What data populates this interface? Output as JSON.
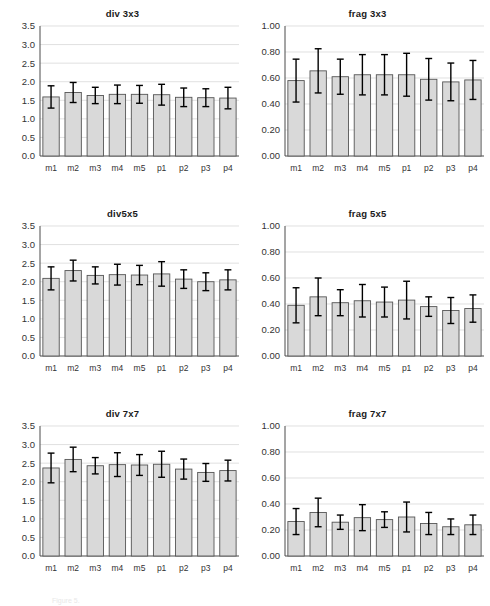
{
  "figure": {
    "background": "#ffffff",
    "bar_fill": "#d9d9d9",
    "bar_stroke": "#555555",
    "error_color": "#000000",
    "gridline_color": "#d2d2d2",
    "axis_color": "#4a4a4a",
    "caption_fragment": "Figure 5."
  },
  "chart_data": [
    {
      "type": "bar",
      "title": "div 3x3",
      "xlabel": "",
      "ylabel": "",
      "ylim": [
        0.0,
        3.5
      ],
      "yticks": [
        0.0,
        0.5,
        1.0,
        1.5,
        2.0,
        2.5,
        3.0,
        3.5
      ],
      "ytick_labels": [
        "0.0",
        "0.5",
        "1.0",
        "1.5",
        "2.0",
        "2.5",
        "3.0",
        "3.5"
      ],
      "grid": true,
      "legend": "none",
      "categories": [
        "m1",
        "m2",
        "m3",
        "m4",
        "m5",
        "p1",
        "p2",
        "p3",
        "p4"
      ],
      "values": [
        1.59,
        1.71,
        1.63,
        1.66,
        1.66,
        1.65,
        1.58,
        1.57,
        1.56
      ],
      "errors": [
        0.3,
        0.27,
        0.22,
        0.25,
        0.24,
        0.28,
        0.25,
        0.24,
        0.29
      ]
    },
    {
      "type": "bar",
      "title": "frag 3x3",
      "xlabel": "",
      "ylabel": "",
      "ylim": [
        0.0,
        1.0
      ],
      "yticks": [
        0.0,
        0.2,
        0.4,
        0.6,
        0.8,
        1.0
      ],
      "ytick_labels": [
        "0.00",
        "0.20",
        "0.40",
        "0.60",
        "0.80",
        "1.00"
      ],
      "grid": true,
      "legend": "none",
      "categories": [
        "m1",
        "m2",
        "m3",
        "m4",
        "m5",
        "p1",
        "p2",
        "p3",
        "p4"
      ],
      "values": [
        0.58,
        0.655,
        0.61,
        0.625,
        0.625,
        0.625,
        0.59,
        0.57,
        0.585
      ],
      "errors": [
        0.165,
        0.17,
        0.135,
        0.155,
        0.155,
        0.165,
        0.16,
        0.145,
        0.15
      ]
    },
    {
      "type": "bar",
      "title": "div5x5",
      "xlabel": "",
      "ylabel": "",
      "ylim": [
        0.0,
        3.5
      ],
      "yticks": [
        0.0,
        0.5,
        1.0,
        1.5,
        2.0,
        2.5,
        3.0,
        3.5
      ],
      "ytick_labels": [
        "0.0",
        "0.5",
        "1.0",
        "1.5",
        "2.0",
        "2.5",
        "3.0",
        "3.5"
      ],
      "grid": true,
      "legend": "none",
      "categories": [
        "m1",
        "m2",
        "m3",
        "m4",
        "m5",
        "p1",
        "p2",
        "p3",
        "p4"
      ],
      "values": [
        2.09,
        2.3,
        2.17,
        2.19,
        2.18,
        2.21,
        2.07,
        2.0,
        2.05
      ],
      "errors": [
        0.31,
        0.28,
        0.23,
        0.28,
        0.26,
        0.33,
        0.25,
        0.24,
        0.27
      ]
    },
    {
      "type": "bar",
      "title": "frag 5x5",
      "xlabel": "",
      "ylabel": "",
      "ylim": [
        0.0,
        1.0
      ],
      "yticks": [
        0.0,
        0.2,
        0.4,
        0.6,
        0.8,
        1.0
      ],
      "ytick_labels": [
        "0.00",
        "0.20",
        "0.40",
        "0.60",
        "0.80",
        "1.00"
      ],
      "grid": true,
      "legend": "none",
      "categories": [
        "m1",
        "m2",
        "m3",
        "m4",
        "m5",
        "p1",
        "p2",
        "p3",
        "p4"
      ],
      "values": [
        0.39,
        0.455,
        0.41,
        0.425,
        0.415,
        0.43,
        0.38,
        0.35,
        0.365
      ],
      "errors": [
        0.135,
        0.145,
        0.1,
        0.125,
        0.115,
        0.145,
        0.075,
        0.1,
        0.105
      ]
    },
    {
      "type": "bar",
      "title": "div 7x7",
      "xlabel": "",
      "ylabel": "",
      "ylim": [
        0.0,
        3.5
      ],
      "yticks": [
        0.0,
        0.5,
        1.0,
        1.5,
        2.0,
        2.5,
        3.0,
        3.5
      ],
      "ytick_labels": [
        "0.0",
        "0.5",
        "1.0",
        "1.5",
        "2.0",
        "2.5",
        "3.0",
        "3.5"
      ],
      "grid": true,
      "legend": "none",
      "categories": [
        "m1",
        "m2",
        "m3",
        "m4",
        "m5",
        "p1",
        "p2",
        "p3",
        "p4"
      ],
      "values": [
        2.37,
        2.6,
        2.43,
        2.46,
        2.45,
        2.47,
        2.34,
        2.25,
        2.3
      ],
      "errors": [
        0.4,
        0.33,
        0.22,
        0.32,
        0.28,
        0.35,
        0.27,
        0.24,
        0.28
      ]
    },
    {
      "type": "bar",
      "title": "frag 7x7",
      "xlabel": "",
      "ylabel": "",
      "ylim": [
        0.0,
        1.0
      ],
      "yticks": [
        0.0,
        0.2,
        0.4,
        0.6,
        0.8,
        1.0
      ],
      "ytick_labels": [
        "0.00",
        "0.20",
        "0.40",
        "0.60",
        "0.80",
        "1.00"
      ],
      "grid": true,
      "legend": "none",
      "categories": [
        "m1",
        "m2",
        "m3",
        "m4",
        "m5",
        "p1",
        "p2",
        "p3",
        "p4"
      ],
      "values": [
        0.265,
        0.335,
        0.26,
        0.295,
        0.28,
        0.3,
        0.25,
        0.225,
        0.24
      ],
      "errors": [
        0.1,
        0.11,
        0.055,
        0.1,
        0.06,
        0.115,
        0.085,
        0.06,
        0.075
      ]
    }
  ]
}
